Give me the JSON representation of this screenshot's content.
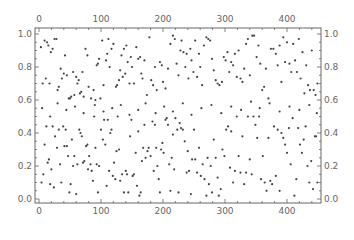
{
  "chart_data": {
    "type": "scatter",
    "title": "",
    "xlabel": "",
    "ylabel": "",
    "xlim": [
      -6,
      456
    ],
    "ylim": [
      -0.03,
      1.03
    ],
    "x_ticks": [
      0,
      100,
      200,
      300,
      400
    ],
    "y_ticks": [
      0.0,
      0.2,
      0.4,
      0.6,
      0.8,
      1.0
    ],
    "x_tick_labels": [
      "0",
      "100",
      "200",
      "300",
      "400"
    ],
    "y_tick_labels": [
      "0.0",
      "0.2",
      "0.4",
      "0.6",
      "0.8",
      "1.0"
    ],
    "frame_ticks_on_all_sides": true,
    "grid": false,
    "legend": null,
    "marker_color": "#444444",
    "axis_color": "#666666",
    "n_points_approx": 450,
    "points": [
      [
        3,
        0.92
      ],
      [
        6,
        0.7
      ],
      [
        9,
        0.96
      ],
      [
        11,
        0.73
      ],
      [
        13,
        0.95
      ],
      [
        15,
        0.93
      ],
      [
        17,
        0.7
      ],
      [
        19,
        0.89
      ],
      [
        22,
        0.91
      ],
      [
        25,
        0.97
      ],
      [
        28,
        0.97
      ],
      [
        30,
        0.66
      ],
      [
        32,
        0.68
      ],
      [
        35,
        0.79
      ],
      [
        37,
        0.73
      ],
      [
        40,
        0.76
      ],
      [
        42,
        0.87
      ],
      [
        45,
        0.75
      ],
      [
        48,
        0.61
      ],
      [
        50,
        0.61
      ],
      [
        52,
        0.62
      ],
      [
        55,
        0.77
      ],
      [
        57,
        0.63
      ],
      [
        60,
        0.74
      ],
      [
        62,
        0.7
      ],
      [
        64,
        0.72
      ],
      [
        66,
        0.64
      ],
      [
        68,
        0.65
      ],
      [
        70,
        0.77
      ],
      [
        72,
        0.62
      ],
      [
        75,
        0.91
      ],
      [
        78,
        0.87
      ],
      [
        80,
        0.68
      ],
      [
        84,
        0.61
      ],
      [
        88,
        0.66
      ],
      [
        91,
        0.6
      ],
      [
        93,
        0.81
      ],
      [
        95,
        0.82
      ],
      [
        97,
        0.85
      ],
      [
        99,
        0.61
      ],
      [
        102,
        0.96
      ],
      [
        104,
        0.69
      ],
      [
        108,
        0.84
      ],
      [
        110,
        0.88
      ],
      [
        112,
        0.97
      ],
      [
        114,
        0.8
      ],
      [
        117,
        0.91
      ],
      [
        120,
        0.94
      ],
      [
        124,
        0.68
      ],
      [
        126,
        0.69
      ],
      [
        129,
        0.72
      ],
      [
        131,
        0.78
      ],
      [
        133,
        0.87
      ],
      [
        135,
        0.74
      ],
      [
        137,
        0.91
      ],
      [
        139,
        0.76
      ],
      [
        141,
        0.93
      ],
      [
        143,
        0.83
      ],
      [
        146,
        0.7
      ],
      [
        148,
        0.86
      ],
      [
        150,
        0.8
      ],
      [
        153,
        0.7
      ],
      [
        157,
        0.92
      ],
      [
        160,
        0.85
      ],
      [
        163,
        0.86
      ],
      [
        165,
        0.76
      ],
      [
        167,
        0.73
      ],
      [
        170,
        0.84
      ],
      [
        174,
        0.63
      ],
      [
        178,
        0.98
      ],
      [
        181,
        0.72
      ],
      [
        184,
        0.69
      ],
      [
        187,
        0.8
      ],
      [
        190,
        0.66
      ],
      [
        195,
        0.83
      ],
      [
        198,
        0.81
      ],
      [
        200,
        0.71
      ],
      [
        204,
        0.67
      ],
      [
        208,
        0.79
      ],
      [
        212,
        0.94
      ],
      [
        216,
        0.99
      ],
      [
        219,
        0.97
      ],
      [
        222,
        0.82
      ],
      [
        225,
        0.75
      ],
      [
        228,
        0.9
      ],
      [
        230,
        0.96
      ],
      [
        233,
        0.89
      ],
      [
        236,
        0.8
      ],
      [
        238,
        0.88
      ],
      [
        241,
        0.73
      ],
      [
        244,
        0.91
      ],
      [
        246,
        0.84
      ],
      [
        249,
        0.77
      ],
      [
        252,
        0.96
      ],
      [
        255,
        0.74
      ],
      [
        258,
        0.88
      ],
      [
        260,
        0.8
      ],
      [
        263,
        0.69
      ],
      [
        266,
        0.93
      ],
      [
        270,
        0.98
      ],
      [
        273,
        0.97
      ],
      [
        276,
        0.96
      ],
      [
        279,
        0.85
      ],
      [
        282,
        0.78
      ],
      [
        285,
        0.72
      ],
      [
        288,
        0.7
      ],
      [
        291,
        0.69
      ],
      [
        295,
        0.71
      ],
      [
        298,
        0.86
      ],
      [
        301,
        0.84
      ],
      [
        304,
        0.89
      ],
      [
        307,
        0.77
      ],
      [
        310,
        0.83
      ],
      [
        313,
        0.81
      ],
      [
        316,
        0.88
      ],
      [
        319,
        0.74
      ],
      [
        322,
        0.9
      ],
      [
        325,
        0.73
      ],
      [
        328,
        0.71
      ],
      [
        331,
        0.79
      ],
      [
        334,
        0.94
      ],
      [
        337,
        0.97
      ],
      [
        340,
        0.75
      ],
      [
        344,
        0.99
      ],
      [
        347,
        0.99
      ],
      [
        351,
        0.86
      ],
      [
        354,
        0.93
      ],
      [
        357,
        0.82
      ],
      [
        360,
        0.66
      ],
      [
        363,
        0.68
      ],
      [
        366,
        0.79
      ],
      [
        370,
        0.61
      ],
      [
        374,
        0.91
      ],
      [
        378,
        0.91
      ],
      [
        382,
        0.88
      ],
      [
        385,
        0.81
      ],
      [
        388,
        0.93
      ],
      [
        391,
        0.71
      ],
      [
        394,
        0.98
      ],
      [
        397,
        0.83
      ],
      [
        400,
        0.95
      ],
      [
        404,
        0.82
      ],
      [
        407,
        0.77
      ],
      [
        410,
        0.94
      ],
      [
        413,
        0.84
      ],
      [
        416,
        0.77
      ],
      [
        419,
        0.97
      ],
      [
        422,
        0.73
      ],
      [
        425,
        0.89
      ],
      [
        428,
        0.64
      ],
      [
        431,
        0.81
      ],
      [
        434,
        0.69
      ],
      [
        437,
        0.66
      ],
      [
        440,
        0.9
      ],
      [
        443,
        0.66
      ],
      [
        446,
        0.63
      ],
      [
        449,
        0.7
      ],
      [
        4,
        0.1
      ],
      [
        7,
        0.15
      ],
      [
        9,
        0.33
      ],
      [
        12,
        0.44
      ],
      [
        14,
        0.22
      ],
      [
        16,
        0.24
      ],
      [
        18,
        0.09
      ],
      [
        20,
        0.18
      ],
      [
        22,
        0.44
      ],
      [
        24,
        0.07
      ],
      [
        26,
        0.38
      ],
      [
        29,
        0.31
      ],
      [
        32,
        0.42
      ],
      [
        34,
        0.21
      ],
      [
        36,
        0.1
      ],
      [
        39,
        0.44
      ],
      [
        41,
        0.32
      ],
      [
        43,
        0.42
      ],
      [
        45,
        0.32
      ],
      [
        47,
        0.26
      ],
      [
        49,
        0.04
      ],
      [
        51,
        0.09
      ],
      [
        53,
        0.36
      ],
      [
        55,
        0.2
      ],
      [
        57,
        0.26
      ],
      [
        60,
        0.03
      ],
      [
        62,
        0.21
      ],
      [
        65,
        0.42
      ],
      [
        67,
        0.4
      ],
      [
        69,
        0.38
      ],
      [
        71,
        0.22
      ],
      [
        73,
        0.23
      ],
      [
        76,
        0.32
      ],
      [
        78,
        0.33
      ],
      [
        79,
        0.18
      ],
      [
        81,
        0.26
      ],
      [
        83,
        0.21
      ],
      [
        85,
        0.17
      ],
      [
        87,
        0.11
      ],
      [
        89,
        0.5
      ],
      [
        91,
        0.31
      ],
      [
        93,
        0.21
      ],
      [
        95,
        0.04
      ],
      [
        97,
        0.2
      ],
      [
        100,
        0.42
      ],
      [
        103,
        0.36
      ],
      [
        105,
        0.48
      ],
      [
        107,
        0.33
      ],
      [
        109,
        0.08
      ],
      [
        111,
        0.48
      ],
      [
        113,
        0.17
      ],
      [
        115,
        0.4
      ],
      [
        117,
        0.42
      ],
      [
        119,
        0.14
      ],
      [
        121,
        0.22
      ],
      [
        123,
        0.12
      ],
      [
        125,
        0.29
      ],
      [
        127,
        0.5
      ],
      [
        129,
        0.3
      ],
      [
        131,
        0.11
      ],
      [
        134,
        0.15
      ],
      [
        137,
        0.04
      ],
      [
        140,
        0.17
      ],
      [
        142,
        0.15
      ],
      [
        144,
        0.04
      ],
      [
        147,
        0.38
      ],
      [
        149,
        0.48
      ],
      [
        151,
        0.14
      ],
      [
        153,
        0.15
      ],
      [
        156,
        0.28
      ],
      [
        158,
        0.08
      ],
      [
        160,
        0.41
      ],
      [
        162,
        0.02
      ],
      [
        164,
        0.04
      ],
      [
        166,
        0.23
      ],
      [
        168,
        0.31
      ],
      [
        170,
        0.45
      ],
      [
        172,
        0.25
      ],
      [
        175,
        0.29
      ],
      [
        177,
        0.31
      ],
      [
        180,
        0.26
      ],
      [
        183,
        0.47
      ],
      [
        185,
        0.17
      ],
      [
        187,
        0.45
      ],
      [
        189,
        0.31
      ],
      [
        191,
        0.2
      ],
      [
        193,
        0.12
      ],
      [
        195,
        0.04
      ],
      [
        197,
        0.3
      ],
      [
        199,
        0.34
      ],
      [
        201,
        0.28
      ],
      [
        204,
        0.48
      ],
      [
        206,
        0.49
      ],
      [
        208,
        0.45
      ],
      [
        210,
        0.21
      ],
      [
        212,
        0.05
      ],
      [
        214,
        0.25
      ],
      [
        216,
        0.39
      ],
      [
        218,
        0.18
      ],
      [
        220,
        0.49
      ],
      [
        223,
        0.42
      ],
      [
        225,
        0.04
      ],
      [
        227,
        0.46
      ],
      [
        229,
        0.43
      ],
      [
        232,
        0.42
      ],
      [
        235,
        0.35
      ],
      [
        238,
        0.16
      ],
      [
        240,
        0.29
      ],
      [
        242,
        0.17
      ],
      [
        245,
        0.03
      ],
      [
        247,
        0.24
      ],
      [
        250,
        0.42
      ],
      [
        252,
        0.24
      ],
      [
        255,
        0.16
      ],
      [
        258,
        0.31
      ],
      [
        261,
        0.14
      ],
      [
        264,
        0.21
      ],
      [
        267,
        0.12
      ],
      [
        270,
        0.02
      ],
      [
        272,
        0.25
      ],
      [
        274,
        0.09
      ],
      [
        277,
        0.2
      ],
      [
        279,
        0.04
      ],
      [
        282,
        0.36
      ],
      [
        285,
        0.25
      ],
      [
        288,
        0.13
      ],
      [
        290,
        0.02
      ],
      [
        293,
        0.06
      ],
      [
        296,
        0.3
      ],
      [
        299,
        0.26
      ],
      [
        302,
        0.42
      ],
      [
        305,
        0.44
      ],
      [
        308,
        0.19
      ],
      [
        310,
        0.41
      ],
      [
        313,
        0.1
      ],
      [
        316,
        0.17
      ],
      [
        319,
        0.5
      ],
      [
        322,
        0.26
      ],
      [
        325,
        0.16
      ],
      [
        328,
        0.38
      ],
      [
        331,
        0.09
      ],
      [
        334,
        0.16
      ],
      [
        337,
        0.5
      ],
      [
        340,
        0.24
      ],
      [
        343,
        0.15
      ],
      [
        346,
        0.5
      ],
      [
        349,
        0.45
      ],
      [
        352,
        0.37
      ],
      [
        355,
        0.5
      ],
      [
        358,
        0.12
      ],
      [
        361,
        0.26
      ],
      [
        364,
        0.1
      ],
      [
        367,
        0.05
      ],
      [
        370,
        0.37
      ],
      [
        373,
        0.11
      ],
      [
        376,
        0.09
      ],
      [
        379,
        0.44
      ],
      [
        382,
        0.14
      ],
      [
        385,
        0.42
      ],
      [
        388,
        0.05
      ],
      [
        391,
        0.4
      ],
      [
        394,
        0.37
      ],
      [
        397,
        0.33
      ],
      [
        400,
        0.28
      ],
      [
        403,
        0.43
      ],
      [
        406,
        0.21
      ],
      [
        409,
        0.49
      ],
      [
        412,
        0.02
      ],
      [
        415,
        0.12
      ],
      [
        418,
        0.43
      ],
      [
        421,
        0.33
      ],
      [
        424,
        0.28
      ],
      [
        427,
        0.36
      ],
      [
        430,
        0.44
      ],
      [
        433,
        0.2
      ],
      [
        436,
        0.1
      ],
      [
        439,
        0.23
      ],
      [
        442,
        0.06
      ],
      [
        445,
        0.38
      ],
      [
        447,
        0.38
      ],
      [
        449,
        0.1
      ],
      [
        5,
        0.55
      ],
      [
        18,
        0.5
      ],
      [
        30,
        0.58
      ],
      [
        44,
        0.54
      ],
      [
        58,
        0.56
      ],
      [
        72,
        0.52
      ],
      [
        90,
        0.57
      ],
      [
        104,
        0.53
      ],
      [
        118,
        0.55
      ],
      [
        132,
        0.57
      ],
      [
        146,
        0.51
      ],
      [
        160,
        0.54
      ],
      [
        172,
        0.58
      ],
      [
        188,
        0.52
      ],
      [
        202,
        0.56
      ],
      [
        216,
        0.53
      ],
      [
        232,
        0.58
      ],
      [
        246,
        0.51
      ],
      [
        262,
        0.55
      ],
      [
        278,
        0.57
      ],
      [
        294,
        0.52
      ],
      [
        310,
        0.56
      ],
      [
        326,
        0.54
      ],
      [
        342,
        0.59
      ],
      [
        356,
        0.55
      ],
      [
        372,
        0.58
      ],
      [
        388,
        0.53
      ],
      [
        404,
        0.56
      ],
      [
        420,
        0.54
      ],
      [
        436,
        0.57
      ],
      [
        448,
        0.52
      ]
    ]
  },
  "axes": {
    "top_ticks": [
      "0",
      "100",
      "200",
      "300",
      "400"
    ],
    "bottom_ticks": [
      "0",
      "100",
      "200",
      "300",
      "400"
    ],
    "left_ticks": [
      "1.0",
      "0.8",
      "0.6",
      "0.4",
      "0.2",
      "0.0"
    ],
    "right_ticks": [
      "1.0",
      "0.8",
      "0.6",
      "0.4",
      "0.2",
      "0.0"
    ]
  }
}
